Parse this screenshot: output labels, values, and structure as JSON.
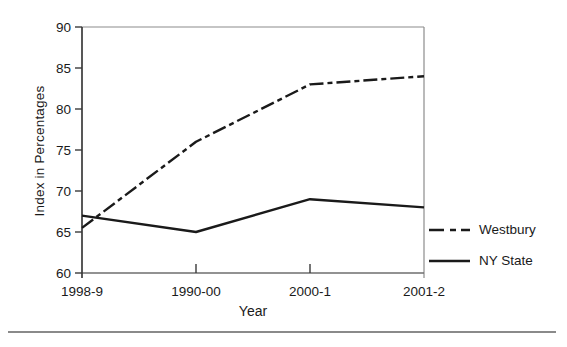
{
  "chart_data": {
    "type": "line",
    "categories": [
      "1998-9",
      "1990-00",
      "2000-1",
      "2001-2"
    ],
    "series": [
      {
        "name": "Westbury",
        "values": [
          65.5,
          76,
          83,
          84
        ],
        "style": "dashed",
        "color": "#1a1a1a"
      },
      {
        "name": "NY State",
        "values": [
          67,
          65,
          69,
          68
        ],
        "style": "solid",
        "color": "#1a1a1a"
      }
    ],
    "title": "",
    "xlabel": "Year",
    "ylabel": "Index in Percentages",
    "ylim": [
      60,
      90
    ],
    "ytick_step": 5,
    "grid": false,
    "legend_position": "right-outside"
  },
  "colors": {
    "text": "#1a1a1a",
    "line": "#1a1a1a",
    "axis_dark": "#3a3a3a",
    "axis_medium": "#6e6e6e",
    "axis_light": "#8c8c8c",
    "divider": "#8a8a8a",
    "background": "#ffffff"
  }
}
